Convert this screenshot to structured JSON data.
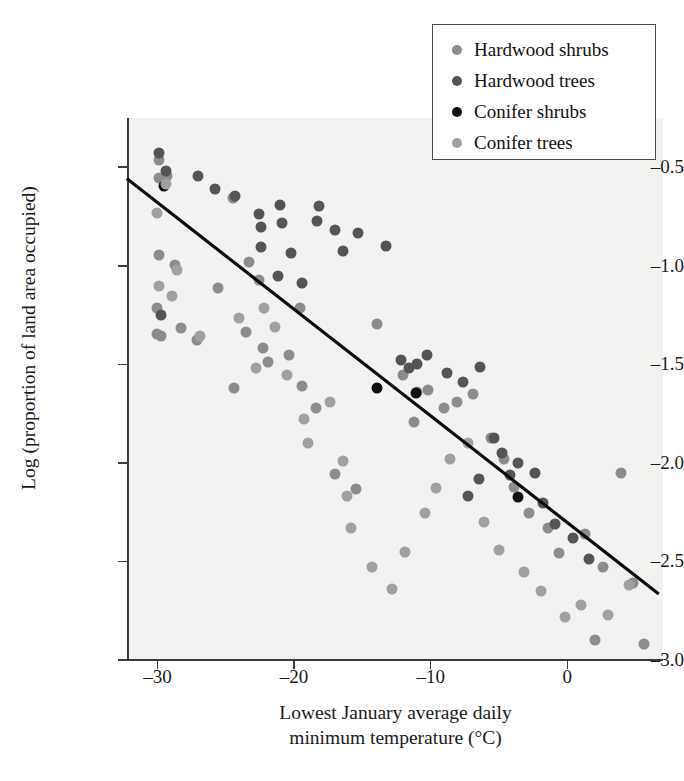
{
  "chart_data": {
    "type": "scatter",
    "title": "",
    "xlabel": "Lowest January average daily minimum temperature (°C)",
    "xlabel_line1": "Lowest January average daily",
    "xlabel_line2": "minimum temperature (°C)",
    "ylabel": "Log (proportion of land area occupied)",
    "xlim": [
      -32.15,
      7.0
    ],
    "ylim": [
      -3.0,
      -0.25
    ],
    "xticks": [
      -30,
      -20,
      -10,
      0
    ],
    "xticklabels": [
      "–30",
      "–20",
      "–10",
      "0"
    ],
    "yticks": [
      -0.5,
      -1.0,
      -1.5,
      -2.0,
      -2.5,
      -3.0
    ],
    "yticklabels": [
      "–0.5",
      "–1.0",
      "–1.5",
      "–2.0",
      "–2.5",
      "–3.0"
    ],
    "grid": false,
    "legend_position": "top-right",
    "colors": {
      "hardwood_shrubs": "#8c8c8c",
      "hardwood_trees": "#545454",
      "conifer_shrubs": "#111111",
      "conifer_trees": "#a0a0a0",
      "regression_line": "#0d0d0d",
      "plot_background": "#f2f2f0",
      "axis": "#3b3b3b",
      "page_background": "#ffffff"
    },
    "trendline": {
      "label": "linear regression",
      "x": [
        -32.15,
        6.6
      ],
      "y": [
        -0.5625,
        -2.66
      ],
      "slope": -0.0543,
      "intercept": -2.304
    },
    "series": [
      {
        "name": "Hardwood shrubs",
        "color": "#8c8c8c",
        "points": [
          [
            -29.9,
            -0.465
          ],
          [
            -29.9,
            -0.555
          ],
          [
            -29.3,
            -0.545
          ],
          [
            -29.9,
            -0.945
          ],
          [
            -28.7,
            -0.995
          ],
          [
            -30.0,
            -1.215
          ],
          [
            -30.0,
            -1.345
          ],
          [
            -29.7,
            -1.355
          ],
          [
            -28.3,
            -1.315
          ],
          [
            -27.1,
            -1.375
          ],
          [
            -24.5,
            -0.655
          ],
          [
            -25.6,
            -1.115
          ],
          [
            -23.3,
            -0.98
          ],
          [
            -22.6,
            -1.07
          ],
          [
            -23.5,
            -1.335
          ],
          [
            -22.3,
            -1.415
          ],
          [
            -21.9,
            -1.49
          ],
          [
            -24.4,
            -1.62
          ],
          [
            -19.6,
            -1.215
          ],
          [
            -20.4,
            -1.45
          ],
          [
            -19.4,
            -1.61
          ],
          [
            -18.4,
            -1.72
          ],
          [
            -17.0,
            -2.055
          ],
          [
            -15.5,
            -2.13
          ],
          [
            -13.9,
            -1.295
          ],
          [
            -12.0,
            -1.555
          ],
          [
            -11.0,
            -1.64
          ],
          [
            -10.2,
            -1.63
          ],
          [
            -11.2,
            -1.79
          ],
          [
            -9.0,
            -1.72
          ],
          [
            -8.1,
            -1.69
          ],
          [
            -6.9,
            -1.65
          ],
          [
            -5.6,
            -1.875
          ],
          [
            -4.6,
            -1.98
          ],
          [
            -3.9,
            -2.12
          ],
          [
            -2.8,
            -2.255
          ],
          [
            -1.4,
            -2.33
          ],
          [
            -0.6,
            -2.455
          ],
          [
            1.3,
            -2.36
          ],
          [
            2.6,
            -2.53
          ],
          [
            3.9,
            -2.05
          ],
          [
            4.8,
            -2.61
          ],
          [
            5.6,
            -2.92
          ],
          [
            2.0,
            -2.9
          ]
        ]
      },
      {
        "name": "Hardwood trees",
        "color": "#545454",
        "points": [
          [
            -29.9,
            -0.43
          ],
          [
            -29.4,
            -0.52
          ],
          [
            -29.7,
            -1.25
          ],
          [
            -27.0,
            -0.545
          ],
          [
            -25.8,
            -0.61
          ],
          [
            -24.3,
            -0.645
          ],
          [
            -22.6,
            -0.735
          ],
          [
            -22.4,
            -0.805
          ],
          [
            -22.4,
            -0.905
          ],
          [
            -21.0,
            -0.69
          ],
          [
            -20.9,
            -0.785
          ],
          [
            -21.2,
            -1.05
          ],
          [
            -20.2,
            -0.935
          ],
          [
            -19.4,
            -1.085
          ],
          [
            -18.2,
            -0.695
          ],
          [
            -18.3,
            -0.775
          ],
          [
            -17.0,
            -0.82
          ],
          [
            -16.4,
            -0.925
          ],
          [
            -15.3,
            -0.835
          ],
          [
            -13.3,
            -0.9
          ],
          [
            -12.2,
            -1.48
          ],
          [
            -11.6,
            -1.52
          ],
          [
            -11.0,
            -1.5
          ],
          [
            -10.3,
            -1.455
          ],
          [
            -8.8,
            -1.545
          ],
          [
            -7.6,
            -1.59
          ],
          [
            -6.4,
            -1.515
          ],
          [
            -5.4,
            -1.875
          ],
          [
            -4.8,
            -1.95
          ],
          [
            -4.2,
            -2.06
          ],
          [
            -3.6,
            -2.0
          ],
          [
            -2.4,
            -2.05
          ],
          [
            -1.8,
            -2.205
          ],
          [
            -0.9,
            -2.31
          ],
          [
            0.4,
            -2.38
          ],
          [
            1.6,
            -2.49
          ],
          [
            -6.5,
            -2.08
          ],
          [
            -7.3,
            -2.17
          ]
        ]
      },
      {
        "name": "Conifer shrubs",
        "color": "#111111",
        "points": [
          [
            -29.5,
            -0.595
          ],
          [
            -13.9,
            -1.62
          ],
          [
            -11.1,
            -1.645
          ],
          [
            -3.6,
            -2.175
          ]
        ]
      },
      {
        "name": "Conifer trees",
        "color": "#a0a0a0",
        "points": [
          [
            -29.4,
            -0.585
          ],
          [
            -30.0,
            -0.73
          ],
          [
            -29.9,
            -1.1
          ],
          [
            -28.9,
            -1.155
          ],
          [
            -28.6,
            -1.02
          ],
          [
            -26.9,
            -1.355
          ],
          [
            -24.0,
            -1.265
          ],
          [
            -22.2,
            -1.215
          ],
          [
            -22.8,
            -1.52
          ],
          [
            -21.4,
            -1.31
          ],
          [
            -20.5,
            -1.555
          ],
          [
            -19.3,
            -1.775
          ],
          [
            -19.0,
            -1.9
          ],
          [
            -17.4,
            -1.69
          ],
          [
            -16.4,
            -1.99
          ],
          [
            -16.1,
            -2.17
          ],
          [
            -15.8,
            -2.33
          ],
          [
            -14.3,
            -2.53
          ],
          [
            -12.8,
            -2.64
          ],
          [
            -11.9,
            -2.45
          ],
          [
            -10.4,
            -2.255
          ],
          [
            -9.6,
            -2.125
          ],
          [
            -8.6,
            -1.98
          ],
          [
            -7.3,
            -1.9
          ],
          [
            -6.1,
            -2.3
          ],
          [
            -5.0,
            -2.44
          ],
          [
            -3.2,
            -2.555
          ],
          [
            -1.9,
            -2.65
          ],
          [
            -0.2,
            -2.78
          ],
          [
            1.0,
            -2.72
          ],
          [
            3.0,
            -2.77
          ],
          [
            4.5,
            -2.62
          ]
        ]
      }
    ]
  },
  "legend": {
    "items": [
      {
        "label": "Hardwood shrubs",
        "color": "#8c8c8c"
      },
      {
        "label": "Hardwood trees",
        "color": "#545454"
      },
      {
        "label": "Conifer shrubs",
        "color": "#111111"
      },
      {
        "label": "Conifer trees",
        "color": "#a0a0a0"
      }
    ]
  }
}
